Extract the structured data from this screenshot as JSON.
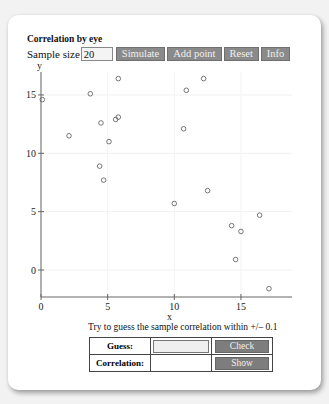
{
  "app": {
    "title": "Correlation by eye"
  },
  "controls": {
    "sample_size_label": "Sample size",
    "sample_size_value": "20",
    "buttons": [
      {
        "label": "Simulate"
      },
      {
        "label": "Add point"
      },
      {
        "label": "Reset"
      },
      {
        "label": "Info"
      }
    ]
  },
  "prompt": "Try to guess the sample correlation within +/– 0.1",
  "table": {
    "guess_label": "Guess:",
    "guess_value": "",
    "check_label": "Check",
    "correlation_label": "Correlation:",
    "correlation_value": "",
    "show_label": "Show"
  },
  "colors": {
    "button_bg": "#8a8a8a",
    "button_text": "#f0f0f0",
    "point_stroke": "#555555"
  },
  "chart_data": {
    "type": "scatter",
    "title": "",
    "xlabel": "x",
    "ylabel": "y",
    "x_ticks": [
      0,
      5,
      10,
      15
    ],
    "y_ticks": [
      0,
      5,
      10,
      15
    ],
    "xlim": [
      -0.3,
      18.5
    ],
    "ylim": [
      -2.5,
      17.5
    ],
    "grid": true,
    "points": [
      {
        "x": 0.1,
        "y": 14.6
      },
      {
        "x": 3.7,
        "y": 15.1
      },
      {
        "x": 5.8,
        "y": 16.4
      },
      {
        "x": 4.5,
        "y": 12.6
      },
      {
        "x": 5.6,
        "y": 12.9
      },
      {
        "x": 5.8,
        "y": 13.1
      },
      {
        "x": 2.1,
        "y": 11.5
      },
      {
        "x": 5.1,
        "y": 11.0
      },
      {
        "x": 4.4,
        "y": 8.9
      },
      {
        "x": 4.7,
        "y": 7.7
      },
      {
        "x": 10.9,
        "y": 15.4
      },
      {
        "x": 12.2,
        "y": 16.4
      },
      {
        "x": 10.7,
        "y": 12.1
      },
      {
        "x": 10.0,
        "y": 5.7
      },
      {
        "x": 12.5,
        "y": 6.8
      },
      {
        "x": 14.3,
        "y": 3.8
      },
      {
        "x": 15.0,
        "y": 3.3
      },
      {
        "x": 16.4,
        "y": 4.7
      },
      {
        "x": 14.6,
        "y": 0.9
      },
      {
        "x": 17.1,
        "y": -1.6
      }
    ]
  }
}
